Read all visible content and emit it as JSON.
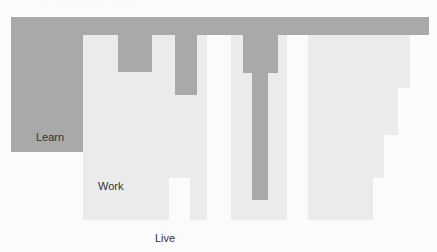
{
  "title_cutoff": "· · ·  ··· ··· ·· ·· ····",
  "colors": {
    "learn": "#a9a9a9",
    "work": "#ebebeb",
    "live": "#fbfbfb"
  },
  "labels": {
    "learn": "Learn",
    "work": "Work",
    "live": "Live"
  }
}
